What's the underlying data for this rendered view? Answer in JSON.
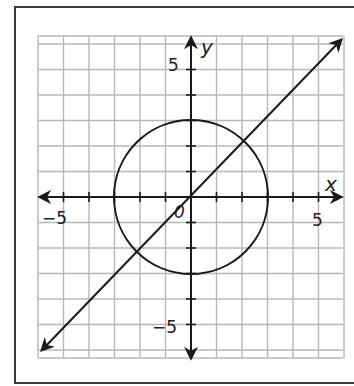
{
  "chart_data": {
    "type": "line",
    "title": "",
    "xlabel": "x",
    "ylabel": "y",
    "xlim": [
      -6,
      6
    ],
    "ylim": [
      -6.3,
      6.3
    ],
    "grid": true,
    "grid_step": 1,
    "x_tick_labels": [
      "-5",
      "5"
    ],
    "y_tick_labels": [
      "5",
      "-5"
    ],
    "origin_label": "0",
    "series": [
      {
        "name": "circle",
        "shape": "circle",
        "center": [
          0,
          0
        ],
        "radius": 3,
        "equation": "x^2 + y^2 = 9"
      },
      {
        "name": "line",
        "shape": "line",
        "slope": 1,
        "intercept": 0,
        "equation": "y = x",
        "arrows": "both",
        "from": [
          -6,
          -6
        ],
        "to": [
          6,
          6
        ]
      }
    ],
    "intersections": [
      [
        2.12,
        2.12
      ],
      [
        -2.12,
        -2.12
      ]
    ]
  },
  "labels": {
    "x_axis": "x",
    "y_axis": "y",
    "origin": "0",
    "x_neg5": "−5",
    "x_pos5": "5",
    "y_pos5": "5",
    "y_neg5": "−5"
  },
  "colors": {
    "grid": "#b8b8b8",
    "axis": "#1a1a1a",
    "curve": "#1a1a1a"
  }
}
